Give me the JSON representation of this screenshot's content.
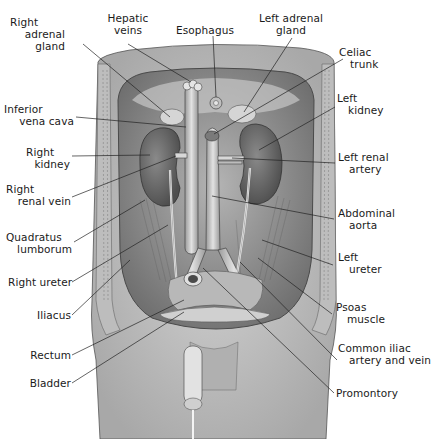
{
  "diagram": {
    "labels_left": [
      {
        "id": "right-adrenal-gland",
        "lines": [
          "Right",
          "adrenal",
          "gland"
        ]
      },
      {
        "id": "inferior-vena-cava",
        "lines": [
          "Inferior",
          "vena cava"
        ]
      },
      {
        "id": "right-kidney",
        "lines": [
          "Right",
          "kidney"
        ]
      },
      {
        "id": "right-renal-vein",
        "lines": [
          "Right",
          "renal vein"
        ]
      },
      {
        "id": "quadratus-lumborum",
        "lines": [
          "Quadratus",
          "lumborum"
        ]
      },
      {
        "id": "right-ureter",
        "lines": [
          "Right ureter"
        ]
      },
      {
        "id": "iliacus",
        "lines": [
          "Iliacus"
        ]
      },
      {
        "id": "rectum",
        "lines": [
          "Rectum"
        ]
      },
      {
        "id": "bladder",
        "lines": [
          "Bladder"
        ]
      }
    ],
    "labels_top": [
      {
        "id": "hepatic-veins",
        "lines": [
          "Hepatic",
          "veins"
        ]
      },
      {
        "id": "esophagus",
        "lines": [
          "Esophagus"
        ]
      },
      {
        "id": "left-adrenal-gland",
        "lines": [
          "Left adrenal",
          "gland"
        ]
      }
    ],
    "labels_right": [
      {
        "id": "celiac-trunk",
        "lines": [
          "Celiac",
          "trunk"
        ]
      },
      {
        "id": "left-kidney",
        "lines": [
          "Left",
          "kidney"
        ]
      },
      {
        "id": "left-renal-artery",
        "lines": [
          "Left renal",
          "artery"
        ]
      },
      {
        "id": "abdominal-aorta",
        "lines": [
          "Abdominal",
          "aorta"
        ]
      },
      {
        "id": "left-ureter",
        "lines": [
          "Left",
          "ureter"
        ]
      },
      {
        "id": "psoas-muscle",
        "lines": [
          "Psoas",
          "muscle"
        ]
      },
      {
        "id": "common-iliac",
        "lines": [
          "Common iliac",
          "artery and vein"
        ]
      },
      {
        "id": "promontory",
        "lines": [
          "Promontory"
        ]
      }
    ]
  },
  "colors": {
    "skin": "#c9c9c9",
    "cavity": "#9a9a9a",
    "organ": "#6e6e6e",
    "vessel": "#d8d8d8",
    "line": "#222222"
  }
}
